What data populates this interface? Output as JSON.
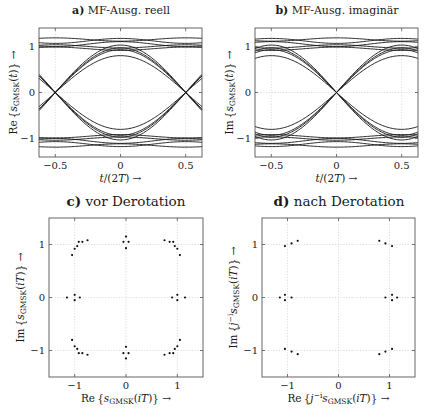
{
  "panels": {
    "a": {
      "letter": "a)",
      "title": "MF-Ausg. reell"
    },
    "b": {
      "letter": "b)",
      "title": "MF-Ausg. imaginär"
    },
    "c": {
      "letter": "c)",
      "title": "vor Derotation"
    },
    "d": {
      "letter": "d)",
      "title": "nach Derotation"
    }
  },
  "chart_data": [
    {
      "id": "a",
      "type": "line",
      "title": "a) MF-Ausg. reell",
      "xlabel": "t/(2T) →",
      "ylabel": "Re{s_GMSK(t)} →",
      "xlim": [
        -0.625,
        0.625
      ],
      "ylim": [
        -1.4,
        1.4
      ],
      "xticks": [
        -0.5,
        0,
        0.5
      ],
      "yticks": [
        -1,
        0,
        1
      ],
      "grid": true,
      "description": "Eye diagram: transitions crossing zero at t/(2T)=±0.5, eye maximum opening at t=0, levels clustered near ±1 (approx 0.8–1.15)",
      "eye_levels": [
        -1.15,
        -1.05,
        -1.0,
        -0.95,
        -0.8,
        0.8,
        0.95,
        1.0,
        1.05,
        1.15
      ],
      "zero_crossings": [
        -0.5,
        0.5
      ]
    },
    {
      "id": "b",
      "type": "line",
      "title": "b) MF-Ausg. imaginär",
      "xlabel": "t/(2T) →",
      "ylabel": "Im{s_GMSK(t)} →",
      "xlim": [
        -0.625,
        0.625
      ],
      "ylim": [
        -1.4,
        1.4
      ],
      "xticks": [
        -0.5,
        0,
        0.5
      ],
      "yticks": [
        -1,
        0,
        1
      ],
      "grid": true,
      "description": "Eye diagram: transitions crossing zero at t=0, eye maxima at t/(2T)=±0.5, levels near ±1 (approx 0.8–1.15)",
      "eye_levels": [
        -1.15,
        -1.05,
        -1.0,
        -0.95,
        -0.8,
        0.8,
        0.95,
        1.0,
        1.05,
        1.15
      ],
      "zero_crossings": [
        0
      ]
    },
    {
      "id": "c",
      "type": "scatter",
      "title": "c) vor Derotation",
      "xlabel": "Re{s_GMSK(iT)} →",
      "ylabel": "Im{s_GMSK(iT)} →",
      "xlim": [
        -1.5,
        1.5
      ],
      "ylim": [
        -1.5,
        1.5
      ],
      "xticks": [
        -1,
        0,
        1
      ],
      "yticks": [
        -1,
        0,
        1
      ],
      "grid": true,
      "points": [
        [
          -1.05,
          0.8
        ],
        [
          -1.0,
          0.92
        ],
        [
          -0.95,
          0.97
        ],
        [
          -0.92,
          1.05
        ],
        [
          -0.85,
          1.05
        ],
        [
          -0.75,
          1.08
        ],
        [
          0.0,
          1.15
        ],
        [
          -0.05,
          1.05
        ],
        [
          0.05,
          1.05
        ],
        [
          0.0,
          0.93
        ],
        [
          0.75,
          1.08
        ],
        [
          0.85,
          1.05
        ],
        [
          0.92,
          1.05
        ],
        [
          0.95,
          0.97
        ],
        [
          1.0,
          0.92
        ],
        [
          1.05,
          0.8
        ],
        [
          -1.15,
          0.0
        ],
        [
          -1.0,
          0.05
        ],
        [
          -1.0,
          -0.05
        ],
        [
          -0.9,
          0.0
        ],
        [
          0.9,
          0.0
        ],
        [
          1.0,
          0.05
        ],
        [
          1.0,
          -0.05
        ],
        [
          1.15,
          0.0
        ],
        [
          -1.05,
          -0.8
        ],
        [
          -1.0,
          -0.92
        ],
        [
          -0.95,
          -0.97
        ],
        [
          -0.92,
          -1.05
        ],
        [
          -0.85,
          -1.05
        ],
        [
          -0.75,
          -1.08
        ],
        [
          0.0,
          -0.93
        ],
        [
          -0.05,
          -1.05
        ],
        [
          0.05,
          -1.05
        ],
        [
          0.0,
          -1.15
        ],
        [
          0.75,
          -1.08
        ],
        [
          0.85,
          -1.05
        ],
        [
          0.92,
          -1.05
        ],
        [
          0.95,
          -0.97
        ],
        [
          1.0,
          -0.92
        ],
        [
          1.05,
          -0.8
        ]
      ]
    },
    {
      "id": "d",
      "type": "scatter",
      "title": "d) nach Derotation",
      "xlabel": "Re{j^-i s_GMSK(iT)} →",
      "ylabel": "Im{j^-i s_GMSK(iT)} →",
      "xlim": [
        -1.5,
        1.5
      ],
      "ylim": [
        -1.5,
        1.5
      ],
      "xticks": [
        -1,
        0,
        1
      ],
      "yticks": [
        -1,
        0,
        1
      ],
      "grid": true,
      "points": [
        [
          -1.05,
          0.97
        ],
        [
          -0.92,
          1.02
        ],
        [
          -0.8,
          1.07
        ],
        [
          0.8,
          1.07
        ],
        [
          0.92,
          1.02
        ],
        [
          1.05,
          0.97
        ],
        [
          -1.15,
          0.0
        ],
        [
          -1.05,
          0.05
        ],
        [
          -1.05,
          -0.05
        ],
        [
          -0.92,
          0.0
        ],
        [
          0.92,
          0.0
        ],
        [
          1.05,
          0.05
        ],
        [
          1.05,
          -0.05
        ],
        [
          1.15,
          0.0
        ],
        [
          -1.05,
          -0.97
        ],
        [
          -0.92,
          -1.02
        ],
        [
          -0.8,
          -1.07
        ],
        [
          0.8,
          -1.07
        ],
        [
          0.92,
          -1.02
        ],
        [
          1.05,
          -0.97
        ]
      ]
    }
  ]
}
